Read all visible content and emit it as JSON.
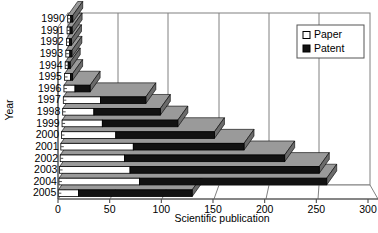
{
  "chart_data": {
    "type": "bar",
    "orientation": "horizontal",
    "stacked": true,
    "title": "",
    "xlabel": "Scientific publication",
    "ylabel": "Year",
    "xlim": [
      0,
      300
    ],
    "xticks": [
      0,
      50,
      100,
      150,
      200,
      250,
      300
    ],
    "grid": true,
    "legend_position": "top-right",
    "categories": [
      "1990",
      "1991",
      "1992",
      "1993",
      "1994",
      "1995",
      "1996",
      "1997",
      "1998",
      "1999",
      "2000",
      "2001",
      "2002",
      "2003",
      "2004",
      "2005"
    ],
    "series": [
      {
        "name": "Paper",
        "color": "#ffffff",
        "values": [
          3,
          3,
          3,
          4,
          3,
          6,
          11,
          37,
          31,
          40,
          54,
          72,
          64,
          70,
          80,
          20
        ]
      },
      {
        "name": "Patent",
        "color": "#121212",
        "values": [
          2,
          2,
          2,
          2,
          2,
          2,
          15,
          45,
          66,
          75,
          98,
          110,
          159,
          188,
          186,
          113
        ]
      }
    ],
    "totals": [
      5,
      5,
      5,
      6,
      5,
      8,
      26,
      82,
      97,
      115,
      152,
      182,
      223,
      258,
      266,
      133
    ]
  },
  "legend": {
    "items": [
      {
        "label": "Paper",
        "swatch": "paper-swatch-icon"
      },
      {
        "label": "Patent",
        "swatch": "patent-swatch-icon"
      }
    ]
  },
  "axes": {
    "x_title": "Scientific publication",
    "y_title": "Year",
    "x_tick_labels": [
      "0",
      "50",
      "100",
      "150",
      "200",
      "250",
      "300"
    ],
    "y_tick_labels": [
      "1990",
      "1991",
      "1992",
      "1993",
      "1994",
      "1995",
      "1996",
      "1997",
      "1998",
      "1999",
      "2000",
      "2001",
      "2002",
      "2003",
      "2004",
      "2005"
    ]
  }
}
